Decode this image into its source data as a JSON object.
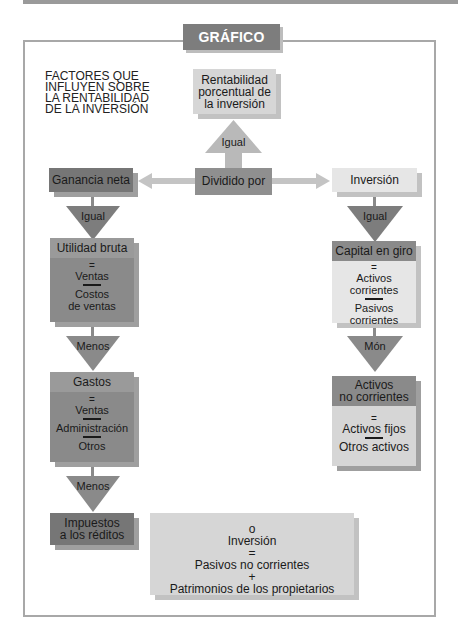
{
  "figure": {
    "badge": "GRÁFICO 8.11",
    "intro_lines": [
      "FACTORES QUE",
      "INFLUYEN SOBRE",
      "LA RENTABILIDAD",
      "DE LA INVERSIÓN"
    ]
  },
  "top": {
    "result_lines": [
      "Rentabilidad",
      "porcentual de",
      "la inversión"
    ],
    "arrow_label": "Igual",
    "center_label": "Dividido por"
  },
  "left": {
    "head": "Ganancia neta",
    "arrow1": "Igual",
    "box1": {
      "title": "Utilidad bruta",
      "eq": "=",
      "item1": "Ventas",
      "item2_lines": [
        "Costos",
        "de ventas"
      ]
    },
    "arrow2": "Menos",
    "box2": {
      "title": "Gastos",
      "eq": "=",
      "item1": "Ventas",
      "item2": "Administración",
      "item3": "Otros"
    },
    "arrow3": "Menos",
    "box3_lines": [
      "Impuestos",
      "a los réditos"
    ]
  },
  "right": {
    "head": "Inversión",
    "arrow1": "Igual",
    "box1": {
      "title": "Capital en giro",
      "eq": "=",
      "item1_lines": [
        "Activos",
        "corrientes"
      ],
      "item2_lines": [
        "Pasivos",
        "corrientes"
      ]
    },
    "arrow2": "Món",
    "box2": {
      "title_lines": [
        "Activos",
        "no corrientes"
      ],
      "eq": "=",
      "item1": "Activos fijos",
      "item2": "Otros activos"
    }
  },
  "alt": {
    "lines": [
      "o",
      "Inversión",
      "=",
      "Pasivos no corrientes",
      "+",
      "Patrimonios de los propietarios"
    ]
  },
  "colors": {
    "dark": "#767676",
    "mid": "#8f8f8f",
    "light": "#d6d6d6",
    "lighter": "#e6e6e6",
    "arrow_light": "#b9b9b9",
    "arrow_dark": "#7d7d7d"
  }
}
